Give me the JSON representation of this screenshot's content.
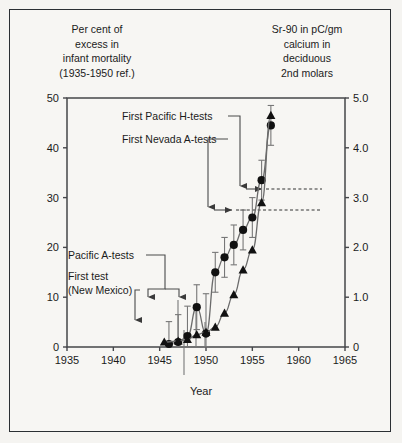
{
  "figure": {
    "left_caption": "Per cent of\nexcess in\ninfant mortality\n(1935-1950 ref.)",
    "left_caption_lines": [
      "Per cent of",
      "excess in",
      "infant mortality",
      "(1935-1950 ref.)"
    ],
    "right_caption_lines": [
      "Sr-90 in pC/gm",
      "calcium in",
      "deciduous",
      "2nd molars"
    ]
  },
  "chart_data": {
    "type": "line",
    "title": "",
    "xlabel": "Year",
    "ylabel": "Per cent of excess in infant mortality (1935-1950 ref.)",
    "y2label": "Sr-90 in pC/gm calcium in deciduous 2nd molars",
    "xlim": [
      1935,
      1965
    ],
    "ylim": [
      0,
      50
    ],
    "y2lim": [
      0,
      5.0
    ],
    "grid": false,
    "legend": "none",
    "xticks": [
      1935,
      1940,
      1945,
      1950,
      1955,
      1960,
      1965
    ],
    "xticklabels": [
      "1935",
      "1940",
      "1945",
      "1950",
      "1955",
      "1960",
      "1965"
    ],
    "yticks": [
      0,
      10,
      20,
      30,
      40,
      50
    ],
    "yticklabels": [
      "0",
      "10",
      "20",
      "30",
      "40",
      "50"
    ],
    "y2ticks": [
      0,
      1.0,
      2.0,
      3.0,
      4.0,
      5.0
    ],
    "y2ticklabels": [
      "0",
      "1.0",
      "2.0",
      "3.0",
      "4.0",
      "5.0"
    ],
    "series": [
      {
        "name": "Per cent excess in infant mortality",
        "marker": "circle",
        "axis": "left",
        "x": [
          1946.0,
          1947.0,
          1948.0,
          1949.0,
          1950.0,
          1951.0,
          1952.0,
          1953.0,
          1954.0,
          1955.0,
          1956.0,
          1957.0
        ],
        "values": [
          0.6,
          1.0,
          2.2,
          8.0,
          2.7,
          15.0,
          18.0,
          20.5,
          23.5,
          26.0,
          33.5,
          44.5
        ],
        "err_lo": [
          0.6,
          1.0,
          2.2,
          4.5,
          2.7,
          4.0,
          4.0,
          4.0,
          4.0,
          4.0,
          4.0,
          4.0
        ],
        "err_hi": [
          4.5,
          5.5,
          6.0,
          4.5,
          8.0,
          4.0,
          4.0,
          4.0,
          4.0,
          4.0,
          4.0,
          4.0
        ]
      },
      {
        "name": "Sr-90 in deciduous 2nd molars",
        "marker": "triangle",
        "axis": "right",
        "x": [
          1945.5,
          1947.0,
          1948.0,
          1949.0,
          1950.0,
          1951.0,
          1952.0,
          1953.0,
          1954.0,
          1955.0,
          1956.0,
          1957.0
        ],
        "values": [
          0.1,
          0.12,
          0.15,
          0.25,
          0.3,
          0.4,
          0.68,
          1.05,
          1.55,
          1.95,
          2.9,
          4.65
        ]
      }
    ],
    "annotations": [
      {
        "id": "first-pacific-h-tests",
        "label": "First Pacific H-tests",
        "year": 1954.1,
        "text_x": 122,
        "text_y": 120
      },
      {
        "id": "first-nevada-a-tests",
        "label": "First Nevada A-tests",
        "year": 1951.2,
        "text_x": 122,
        "text_y": 143
      },
      {
        "id": "pacific-a-tests",
        "label": "Pacific A-tests",
        "year": 1948.2,
        "text_x": 68,
        "text_y": 259
      },
      {
        "id": "first-test-new-mexico",
        "label_lines": [
          "First test",
          "(New Mexico)"
        ],
        "year": 1945.4,
        "text_x": 68,
        "text_y": 280
      }
    ]
  },
  "axis_text": {
    "year_label": "Year"
  },
  "colors": {
    "marker": "#111111",
    "curve": "#6b6b6b",
    "axis": "#46474a",
    "frame": "#2b2f33",
    "background": "#f5f4f1",
    "text": "#1b1b1b"
  }
}
